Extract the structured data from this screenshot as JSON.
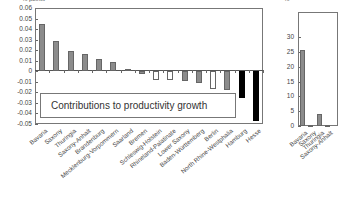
{
  "chart_data": [
    {
      "type": "bar",
      "title": "",
      "ylabel": "% points",
      "xlabel": "",
      "ylim": [
        -0.05,
        0.06
      ],
      "yticks": [
        "0.06",
        "0.05",
        "0.04",
        "0.03",
        "0.02",
        "0.01",
        "0",
        "-0.01",
        "-0.02",
        "-0.03",
        "-0.04",
        "-0.05"
      ],
      "grid": false,
      "legend": {
        "entries": [
          "Contributions to productivity growth"
        ],
        "position": "lower-left inside"
      },
      "categories": [
        "Bavaria",
        "Saxony",
        "Thuringia",
        "Saxony-Anhalt",
        "Brandenburg",
        "Mecklenburg-Vorpommern",
        "Saarland",
        "Bremen",
        "Schleswig-Holstein",
        "Rhineland-Palatinate",
        "Lower Saxony",
        "Baden-Württemberg",
        "Berlin",
        "North Rhine-Westphalia",
        "Hamburg",
        "Hesse"
      ],
      "values": [
        0.045,
        0.029,
        0.019,
        0.016,
        0.012,
        0.009,
        0.002,
        -0.003,
        -0.008,
        -0.008,
        -0.009,
        -0.011,
        -0.017,
        -0.018,
        -0.025,
        -0.047
      ],
      "bar_colors": [
        "#8c8c8c",
        "#8c8c8c",
        "#8c8c8c",
        "#8c8c8c",
        "#8c8c8c",
        "#8c8c8c",
        "#8c8c8c",
        "#8c8c8c",
        "#ffffff",
        "#ffffff",
        "#8c8c8c",
        "#8c8c8c",
        "#ffffff",
        "#8c8c8c",
        "#000000",
        "#000000"
      ]
    },
    {
      "type": "bar",
      "title": "",
      "ylabel": "%",
      "ylim": [
        0,
        30
      ],
      "yticks": [
        "30",
        "25",
        "20",
        "15",
        "10",
        "5",
        "0"
      ],
      "categories": [
        "Bavaria",
        "Saxony",
        "Thuringia",
        "Saxony-Anhalt",
        "Mecklenburg-Vorpommern"
      ],
      "values": [
        25.5,
        0.5,
        4.2,
        0.3,
        1.5
      ],
      "note": "partially visible, cropped at right edge"
    }
  ],
  "left": {
    "unit": "% points",
    "legend_text": "Contributions to productivity growth"
  },
  "right": {
    "unit": "%"
  }
}
